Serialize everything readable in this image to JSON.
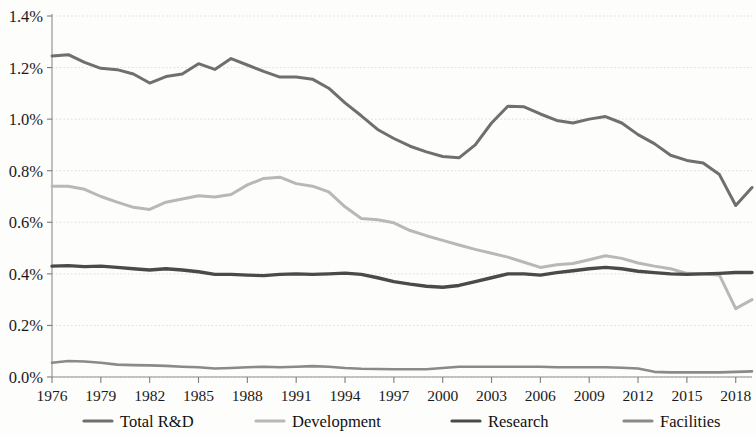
{
  "chart_data": {
    "type": "line",
    "title": "",
    "subtitle": "",
    "xlabel": "",
    "ylabel": "",
    "xlim": [
      1976,
      2019
    ],
    "ylim": [
      0.0,
      1.4
    ],
    "grid": true,
    "grid_axis": "y",
    "legend_position": "bottom",
    "y_tick_labels": [
      "0.0%",
      "0.2%",
      "0.4%",
      "0.6%",
      "0.8%",
      "1.0%",
      "1.2%",
      "1.4%"
    ],
    "y_tick_values": [
      0.0,
      0.2,
      0.4,
      0.6,
      0.8,
      1.0,
      1.2,
      1.4
    ],
    "x_tick_labels": [
      "1976",
      "1979",
      "1982",
      "1985",
      "1988",
      "1991",
      "1994",
      "1997",
      "2000",
      "2003",
      "2006",
      "2009",
      "2012",
      "2015",
      "2018"
    ],
    "x_tick_values": [
      1976,
      1979,
      1982,
      1985,
      1988,
      1991,
      1994,
      1997,
      2000,
      2003,
      2006,
      2009,
      2012,
      2015,
      2018
    ],
    "x": [
      1976,
      1977,
      1978,
      1979,
      1980,
      1981,
      1982,
      1983,
      1984,
      1985,
      1986,
      1987,
      1988,
      1989,
      1990,
      1991,
      1992,
      1993,
      1994,
      1995,
      1996,
      1997,
      1998,
      1999,
      2000,
      2001,
      2002,
      2003,
      2004,
      2005,
      2006,
      2007,
      2008,
      2009,
      2010,
      2011,
      2012,
      2013,
      2014,
      2015,
      2016,
      2017,
      2018,
      2019
    ],
    "series": [
      {
        "name": "Total R&D",
        "color": "#6f6f6f",
        "width": 3.0,
        "values": [
          1.245,
          1.25,
          1.22,
          1.197,
          1.192,
          1.175,
          1.14,
          1.165,
          1.175,
          1.215,
          1.193,
          1.235,
          1.21,
          1.185,
          1.163,
          1.163,
          1.155,
          1.12,
          1.063,
          1.013,
          0.96,
          0.925,
          0.895,
          0.873,
          0.855,
          0.85,
          0.9,
          0.985,
          1.05,
          1.048,
          1.02,
          0.995,
          0.985,
          1.0,
          1.01,
          0.985,
          0.94,
          0.905,
          0.86,
          0.84,
          0.83,
          0.785,
          0.665,
          0.735
        ]
      },
      {
        "name": "Development",
        "color": "#b8b8b8",
        "width": 3.0,
        "values": [
          0.74,
          0.74,
          0.728,
          0.7,
          0.678,
          0.658,
          0.65,
          0.678,
          0.69,
          0.703,
          0.698,
          0.708,
          0.745,
          0.77,
          0.775,
          0.75,
          0.74,
          0.718,
          0.66,
          0.615,
          0.61,
          0.598,
          0.568,
          0.548,
          0.53,
          0.512,
          0.495,
          0.48,
          0.465,
          0.445,
          0.425,
          0.435,
          0.44,
          0.455,
          0.47,
          0.46,
          0.442,
          0.43,
          0.42,
          0.402,
          0.4,
          0.395,
          0.265,
          0.3
        ]
      },
      {
        "name": "Research",
        "color": "#4a4a4a",
        "width": 3.4,
        "values": [
          0.43,
          0.432,
          0.428,
          0.43,
          0.425,
          0.42,
          0.415,
          0.42,
          0.415,
          0.408,
          0.398,
          0.398,
          0.395,
          0.393,
          0.398,
          0.4,
          0.398,
          0.4,
          0.403,
          0.398,
          0.385,
          0.37,
          0.36,
          0.352,
          0.348,
          0.355,
          0.37,
          0.385,
          0.4,
          0.4,
          0.395,
          0.405,
          0.412,
          0.42,
          0.425,
          0.42,
          0.41,
          0.405,
          0.4,
          0.398,
          0.4,
          0.402,
          0.405,
          0.405
        ]
      },
      {
        "name": "Facilities",
        "color": "#8a8a8a",
        "width": 2.6,
        "values": [
          0.055,
          0.062,
          0.06,
          0.055,
          0.048,
          0.046,
          0.045,
          0.043,
          0.04,
          0.038,
          0.033,
          0.035,
          0.038,
          0.04,
          0.038,
          0.04,
          0.042,
          0.04,
          0.035,
          0.032,
          0.031,
          0.03,
          0.03,
          0.03,
          0.035,
          0.04,
          0.04,
          0.04,
          0.04,
          0.04,
          0.04,
          0.038,
          0.038,
          0.038,
          0.038,
          0.036,
          0.033,
          0.02,
          0.018,
          0.018,
          0.018,
          0.018,
          0.02,
          0.022
        ]
      }
    ],
    "legend": [
      {
        "label": "Total R&D",
        "color": "#6f6f6f"
      },
      {
        "label": "Development",
        "color": "#b8b8b8"
      },
      {
        "label": "Research",
        "color": "#4a4a4a"
      },
      {
        "label": "Facilities",
        "color": "#8a8a8a"
      }
    ]
  },
  "style": {
    "gridline_color": "#d9d9d6",
    "axis_color": "#8e8e8e",
    "text_color": "#1a1a1a",
    "background": "#fdfdfc"
  }
}
